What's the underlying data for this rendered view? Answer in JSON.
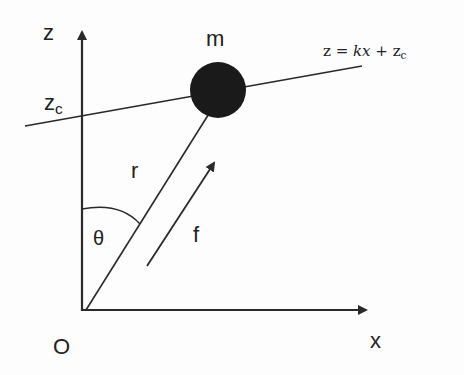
{
  "diagram": {
    "axes": {
      "z_label": "z",
      "x_label": "x",
      "origin_label": "O",
      "intercept_label": "z",
      "intercept_sub": "c"
    },
    "mass": {
      "label": "m",
      "color": "#1a1a1a"
    },
    "line_equation": {
      "lhs": "z = ",
      "k": "k",
      "x": "x",
      "plus": " + z",
      "sub": "c"
    },
    "vector_r_label": "r",
    "force_label": "f",
    "angle_label": "θ",
    "stroke_color": "#2a2a2a"
  }
}
